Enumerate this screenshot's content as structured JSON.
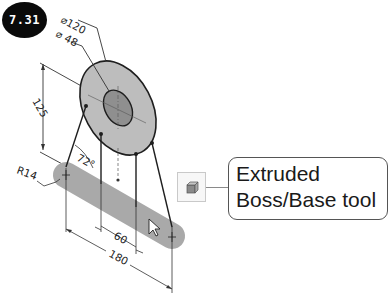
{
  "figure": {
    "number": "7.31"
  },
  "dimensions": {
    "outer_diameter": "⌀120",
    "inner_diameter": "⌀ 48",
    "height": "125",
    "angle": "72°",
    "radius": "R14",
    "inner_spacing": "60",
    "overall_length": "180"
  },
  "callout": {
    "line1": "Extruded",
    "line2": "Boss/Base tool"
  },
  "tool_icon": {
    "name": "extruded-boss-base-icon"
  },
  "colors": {
    "disc_outer": "#bdbdbd",
    "disc_inner": "#8f8f8f",
    "bar": "#a9a9a9",
    "line": "#1e1e1e",
    "badge": "#0a0a0a"
  }
}
